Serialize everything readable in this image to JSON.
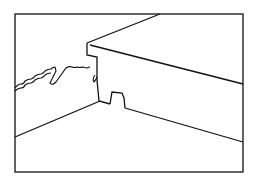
{
  "figure": {
    "stroke_color": "#111111",
    "background": "#ffffff",
    "frame": {
      "x": 15,
      "y": 14,
      "w": 228,
      "h": 158
    },
    "paths": {
      "top_left_edge": "M87,43 L160,14",
      "top_right_edge": "M90,45 L243,84",
      "front_left_outline": "M87,43 L87,56 L97,57 L97,80 L99,101 L110,104",
      "notch": "M110,104 L112,92 L122,93 L124,98 L125,108",
      "bottom_right_edge": "M125,108 L243,142",
      "floor_line": "M15,137 L100,101",
      "torn_line": "M15,88 C22,82 30,80 38,76 C45,73 50,68 55,66 L53,82 L56,84 C62,78 68,70 72,62 C78,63 84,64 90,65 C92,66 96,64 97,62"
    }
  }
}
